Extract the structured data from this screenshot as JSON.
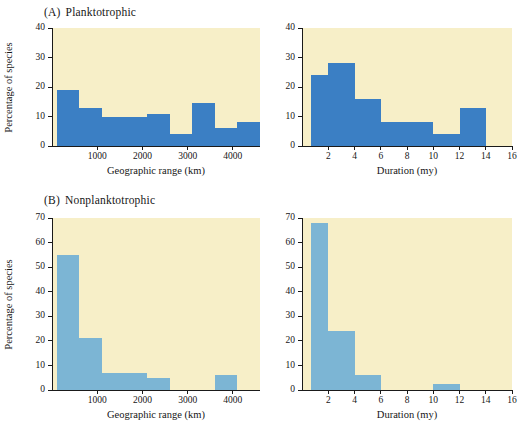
{
  "figure": {
    "background": "#ffffff",
    "plot_background": "#f7efc8",
    "axis_color": "#1a1a1a"
  },
  "panels": [
    {
      "id": "A",
      "tag": "(A)",
      "title": "Planktotrophic",
      "color": "#3b7fc4",
      "ylabel": "Percentage of species"
    },
    {
      "id": "B",
      "tag": "(B)",
      "title": "Nonplanktotrophic",
      "color": "#7cb5d4",
      "ylabel": "Percentage of species"
    }
  ],
  "chart_data": [
    {
      "id": "A-geographic",
      "type": "bar",
      "panel": "A",
      "title": "",
      "xlabel": "Geographic range (km)",
      "ylabel": "Percentage of species",
      "xlim": [
        0,
        4600
      ],
      "ylim": [
        0,
        40
      ],
      "xticks": [
        1000,
        2000,
        3000,
        4000
      ],
      "xtick_labels": [
        "1000",
        "2000",
        "3000",
        "4000"
      ],
      "yticks": [
        0,
        10,
        20,
        30,
        40
      ],
      "ytick_labels": [
        "0",
        "10",
        "20",
        "30",
        "40"
      ],
      "grid": false,
      "legend": "none",
      "bar_color": "#3b7fc4",
      "bin_edges": [
        100,
        600,
        1100,
        1600,
        2100,
        2600,
        3100,
        3600,
        4100,
        4600
      ],
      "bin_labels": [
        "100-600",
        "600-1100",
        "1100-1600",
        "1600-2100",
        "2100-2600",
        "2600-3100",
        "3100-3600",
        "3600-4100",
        "4100-4600"
      ],
      "values": [
        19,
        13,
        10,
        10,
        11,
        4,
        14.5,
        6,
        8
      ]
    },
    {
      "id": "A-duration",
      "type": "bar",
      "panel": "A",
      "title": "",
      "xlabel": "Duration (my)",
      "ylabel": "Percentage of species",
      "xlim": [
        0,
        16
      ],
      "ylim": [
        0,
        40
      ],
      "xticks": [
        2,
        4,
        6,
        8,
        10,
        12,
        14,
        16
      ],
      "xtick_labels": [
        "2",
        "4",
        "6",
        "8",
        "10",
        "12",
        "14",
        "16"
      ],
      "yticks": [
        0,
        10,
        20,
        30,
        40
      ],
      "ytick_labels": [
        "0",
        "10",
        "20",
        "30",
        "40"
      ],
      "grid": false,
      "legend": "none",
      "bar_color": "#3b7fc4",
      "bin_edges": [
        0.7,
        2,
        4,
        6,
        8,
        10,
        12,
        14
      ],
      "bin_labels": [
        "0.7-2",
        "2-4",
        "4-6",
        "6-8",
        "8-10",
        "10-12",
        "12-14"
      ],
      "values": [
        24,
        28,
        16,
        8,
        8,
        4,
        13
      ]
    },
    {
      "id": "B-geographic",
      "type": "bar",
      "panel": "B",
      "title": "",
      "xlabel": "Geographic range (km)",
      "ylabel": "Percentage of species",
      "xlim": [
        0,
        4600
      ],
      "ylim": [
        0,
        70
      ],
      "xticks": [
        1000,
        2000,
        3000,
        4000
      ],
      "xtick_labels": [
        "1000",
        "2000",
        "3000",
        "4000"
      ],
      "yticks": [
        0,
        10,
        20,
        30,
        40,
        50,
        60,
        70
      ],
      "ytick_labels": [
        "0",
        "10",
        "20",
        "30",
        "40",
        "50",
        "60",
        "70"
      ],
      "grid": false,
      "legend": "none",
      "bar_color": "#7cb5d4",
      "bin_edges": [
        100,
        600,
        1100,
        1600,
        2100,
        2600,
        3100,
        3600,
        4100
      ],
      "bin_labels": [
        "100-600",
        "600-1100",
        "1100-1600",
        "1600-2100",
        "2100-2600",
        "2600-3100",
        "3100-3600",
        "3600-4100"
      ],
      "values": [
        55,
        21,
        7,
        7,
        5,
        0,
        0,
        6
      ]
    },
    {
      "id": "B-duration",
      "type": "bar",
      "panel": "B",
      "title": "",
      "xlabel": "Duration (my)",
      "ylabel": "Percentage of species",
      "xlim": [
        0,
        16
      ],
      "ylim": [
        0,
        70
      ],
      "xticks": [
        2,
        4,
        6,
        8,
        10,
        12,
        14,
        16
      ],
      "xtick_labels": [
        "2",
        "4",
        "6",
        "8",
        "10",
        "12",
        "14",
        "16"
      ],
      "yticks": [
        0,
        10,
        20,
        30,
        40,
        50,
        60,
        70
      ],
      "ytick_labels": [
        "0",
        "10",
        "20",
        "30",
        "40",
        "50",
        "60",
        "70"
      ],
      "grid": false,
      "legend": "none",
      "bar_color": "#7cb5d4",
      "bin_edges": [
        0.7,
        2,
        4,
        6,
        8,
        10,
        12
      ],
      "bin_labels": [
        "0.7-2",
        "2-4",
        "4-6",
        "6-8",
        "8-10",
        "10-12"
      ],
      "values": [
        68,
        24,
        6,
        0,
        0,
        2.5
      ]
    }
  ]
}
